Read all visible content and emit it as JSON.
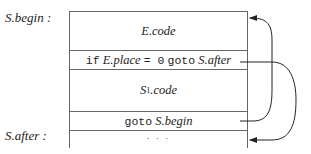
{
  "labels": {
    "begin": "S.begin :",
    "after": "S.after :"
  },
  "cells": {
    "ecode": "E.code",
    "test_kw_if": "if",
    "test_place": "E.place",
    "test_eq": "= 0",
    "test_kw_goto": "goto",
    "test_target": "S.after",
    "s1code_base": "S",
    "s1code_sub": "1",
    "s1code_rest": ".code",
    "goto_kw": "goto",
    "goto_target": "S.begin",
    "ellipsis": "· · ·"
  },
  "arrows": [
    {
      "from": "goto S.begin",
      "to": "S.begin"
    },
    {
      "from": "if E.place = 0 goto S.after",
      "to": "S.after"
    }
  ]
}
